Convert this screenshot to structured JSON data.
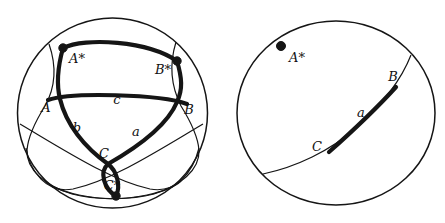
{
  "figure": {
    "description_title": "Spherical triangle with polar triangle (left) and great circle of side a with its pole (right)",
    "colors": {
      "ink": "#151515",
      "background": "#ffffff"
    }
  },
  "left_sphere": {
    "labels": {
      "pole_a": "A*",
      "pole_b": "B*",
      "pole_c": "C*",
      "vertex_a": "A",
      "vertex_b": "B",
      "vertex_c": "C",
      "side_a": "a",
      "side_b": "b",
      "side_c": "c"
    }
  },
  "right_sphere": {
    "labels": {
      "pole_a": "A*",
      "vertex_b": "B",
      "vertex_c": "C",
      "side_a": "a"
    }
  }
}
